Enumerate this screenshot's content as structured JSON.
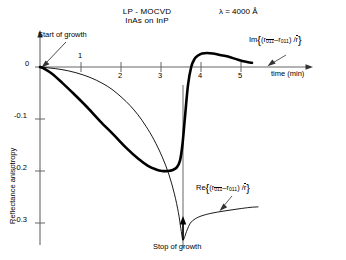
{
  "figure": {
    "title_line1": "LP - MOCVD",
    "title_line2": "InAs on InP",
    "lambda_label": "λ = 4000 Å",
    "start_annotation": "Start of growth",
    "stop_annotation": "Stop of growth",
    "y_axis_label": "Reflectance anisotropy",
    "x_axis_label": "time  (min)",
    "im_legend_prefix": "Im",
    "re_legend_prefix": "Re",
    "legend_r_symbol": "r",
    "legend_sub_bar": "011",
    "legend_sub_plain": "011",
    "legend_denominator": "r",
    "legend_minus": "–",
    "legend_slash": "/",
    "legend_open": "(",
    "legend_close": ")",
    "colors": {
      "ink": "#000000",
      "axis": "#555555",
      "background": "#ffffff",
      "im_curve": "#000000",
      "re_curve": "#000000"
    },
    "x_ticks": [
      "1",
      "2",
      "3",
      "4",
      "5"
    ],
    "y_ticks": [
      "0",
      "-0.1",
      "-0.2",
      "-0.3"
    ]
  },
  "chart_data": {
    "type": "line",
    "xlabel": "time  (min)",
    "ylabel": "Reflectance anisotropy",
    "xlim": [
      0,
      5.6
    ],
    "ylim": [
      -0.35,
      0.04
    ],
    "xticks": [
      1,
      2,
      3,
      4,
      5
    ],
    "yticks": [
      0,
      -0.1,
      -0.2,
      -0.3
    ],
    "grid": false,
    "legend_position": "inline-annotations",
    "annotations": [
      {
        "text": "Start of growth",
        "x": 0.0,
        "y": 0.0
      },
      {
        "text": "Stop of growth",
        "x": 3.55,
        "y": -0.33
      }
    ],
    "series": [
      {
        "name": "Im{(r011bar - r011)/r}",
        "style": "thick",
        "linewidth": 2.6,
        "x": [
          0.0,
          0.12,
          0.3,
          0.55,
          0.85,
          1.15,
          1.5,
          1.85,
          2.15,
          2.45,
          2.7,
          2.9,
          3.05,
          3.2,
          3.32,
          3.42,
          3.5,
          3.56,
          3.62,
          3.7,
          3.78,
          3.86,
          3.95,
          4.05,
          4.18,
          4.32,
          4.5,
          4.7,
          4.95,
          5.15,
          5.3
        ],
        "y": [
          0.0,
          -0.004,
          -0.013,
          -0.03,
          -0.052,
          -0.075,
          -0.104,
          -0.131,
          -0.155,
          -0.176,
          -0.19,
          -0.197,
          -0.2,
          -0.2,
          -0.198,
          -0.193,
          -0.18,
          -0.15,
          -0.1,
          -0.035,
          0.0,
          0.015,
          0.022,
          0.026,
          0.027,
          0.026,
          0.023,
          0.02,
          0.014,
          0.01,
          0.008
        ]
      },
      {
        "name": "Re{(r011bar - r011)/r}",
        "style": "thin",
        "linewidth": 0.9,
        "x": [
          0.0,
          0.25,
          0.55,
          0.9,
          1.25,
          1.55,
          1.8,
          2.05,
          2.25,
          2.45,
          2.65,
          2.85,
          3.05,
          3.22,
          3.36,
          3.46,
          3.52,
          3.56,
          3.58,
          3.62,
          3.68,
          3.76,
          3.88,
          4.05,
          4.3,
          4.6,
          4.95,
          5.25,
          5.45
        ],
        "y": [
          0.0,
          -0.002,
          -0.005,
          -0.011,
          -0.02,
          -0.031,
          -0.043,
          -0.059,
          -0.074,
          -0.092,
          -0.114,
          -0.14,
          -0.172,
          -0.206,
          -0.244,
          -0.28,
          -0.31,
          -0.33,
          -0.333,
          -0.326,
          -0.313,
          -0.3,
          -0.292,
          -0.286,
          -0.281,
          -0.277,
          -0.273,
          -0.27,
          -0.269
        ]
      }
    ]
  }
}
